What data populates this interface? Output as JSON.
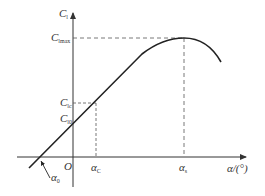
{
  "diagram": {
    "colors": {
      "axis": "#333333",
      "curve": "#222222",
      "dash": "#555555",
      "background": "#ffffff"
    },
    "axes": {
      "y_label_main": "C",
      "y_label_sub": "l",
      "x_label": "α/(°)",
      "origin": "O"
    },
    "y_labels": [
      {
        "main": "C",
        "sub": "lmax"
      },
      {
        "main": "C",
        "sub": "lc"
      },
      {
        "main": "C",
        "sub": "l0"
      }
    ],
    "x_labels": [
      {
        "main": "α",
        "sub": "C"
      },
      {
        "main": "α",
        "sub": "s"
      }
    ],
    "zero_lift_label": {
      "main": "α",
      "sub": "0"
    }
  }
}
